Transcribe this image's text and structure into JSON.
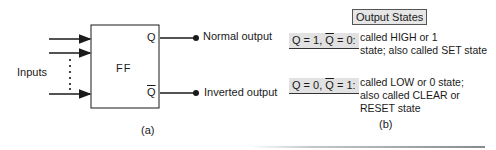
{
  "figure_a": {
    "block_label": "FF",
    "inputs_label": "Inputs",
    "output_q_pin": "Q",
    "output_qbar_pin": "Q",
    "normal_output_label": "Normal output",
    "inverted_output_label": "Inverted output",
    "caption": "(a)",
    "input_arrow_count": 3
  },
  "figure_b": {
    "title": "Output States",
    "states": [
      {
        "key_q": "Q = 1, ",
        "key_qbar": "Q",
        "key_rest": " = 0:",
        "description_lines": [
          "called HIGH or 1",
          "state; also called SET state"
        ]
      },
      {
        "key_q": "Q = 0, ",
        "key_qbar": "Q",
        "key_rest": " = 1:",
        "description_lines": [
          "called LOW or 0 state;",
          "also called CLEAR or",
          "RESET state"
        ]
      }
    ],
    "caption": "(b)"
  }
}
